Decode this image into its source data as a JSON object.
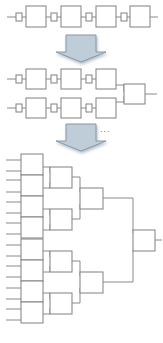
{
  "figure": {
    "type": "pipeline-reduction-tree-progression",
    "background_color": "#ffffff",
    "width": 163,
    "height": 343,
    "box_fill": "#ffffff",
    "box_stroke": "#808080",
    "line_stroke": "#8a8a8a",
    "arrow_fill": "#bfcdd9",
    "arrow_stroke": "#7f92a3",
    "shadow_color": "#9aa7b4",
    "ellipsis_color": "#6b7785"
  },
  "stages": [
    {
      "name": "stage-1-linear-chain",
      "label": "",
      "node_count": 4,
      "level_counts": [
        4
      ],
      "description": "single serial chain of four processing boxes with input stub and output tail"
    },
    {
      "name": "stage-2-two-chains-merge",
      "label": "",
      "node_count": 7,
      "level_counts": [
        6,
        1
      ],
      "description": "two parallel chains of three boxes merging into one box"
    },
    {
      "name": "stage-3-binary-reduction-tree",
      "label": "",
      "node_count": 15,
      "level_counts": [
        8,
        4,
        2,
        1
      ],
      "description": "balanced binary merge tree, eight leaves reducing to one root"
    }
  ],
  "arrows": [
    {
      "name": "transition-arrow-1",
      "direction": "down",
      "label": ""
    },
    {
      "name": "transition-arrow-2",
      "direction": "down",
      "label": ""
    }
  ],
  "annotations": {
    "ellipsis": "...",
    "ellipsis_meaning": ""
  }
}
